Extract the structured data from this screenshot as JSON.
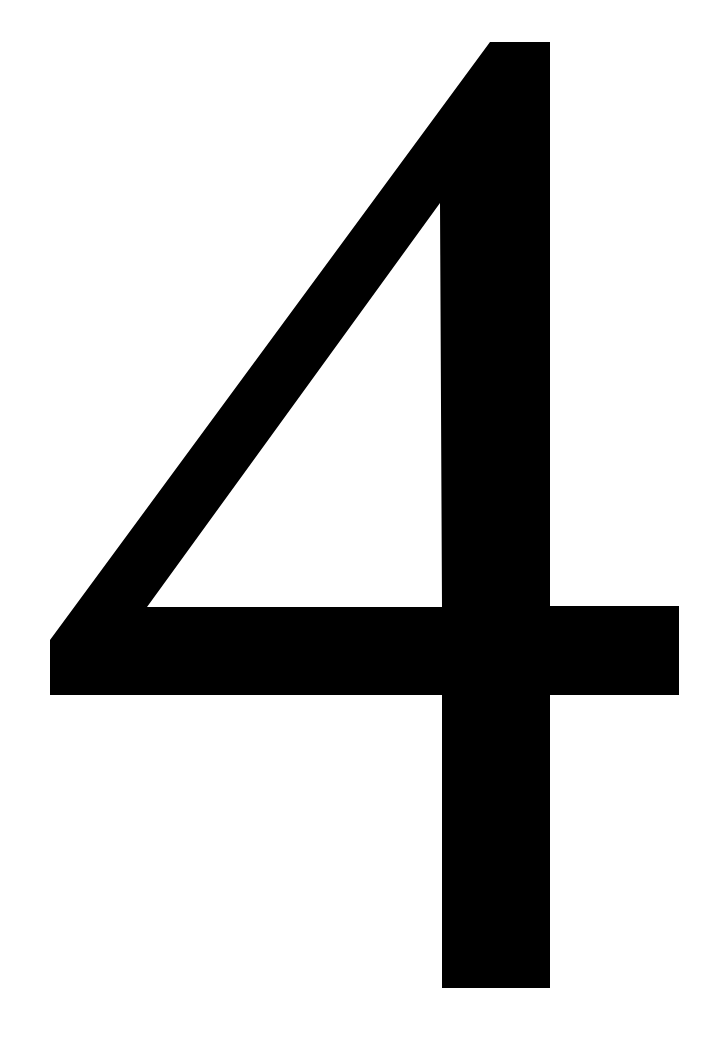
{
  "page": {
    "glyph": "4",
    "background_color": "#ffffff",
    "glyph_color": "#000000"
  }
}
